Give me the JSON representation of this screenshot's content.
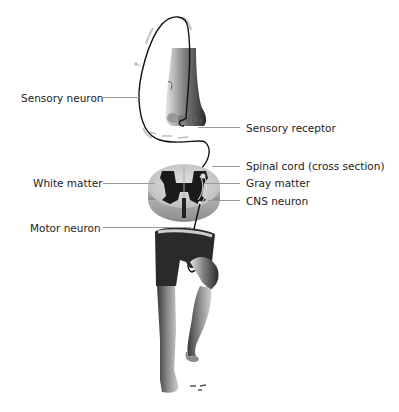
{
  "diagram": {
    "labels": {
      "sensory_neuron": "Sensory neuron",
      "sensory_receptor": "Sensory receptor",
      "spinal_cord": "Spinal cord (cross section)",
      "white_matter": "White matter",
      "gray_matter": "Gray matter",
      "cns_neuron": "CNS neuron",
      "motor_neuron": "Motor neuron"
    },
    "colors": {
      "background": "#ffffff",
      "white_matter": "#d9d9d9",
      "gray_matter": "#1a1a1a",
      "neuron_path": "#111111",
      "leader_line": "#9a9a9a",
      "motion_arrows": "#bdbdbd"
    }
  }
}
